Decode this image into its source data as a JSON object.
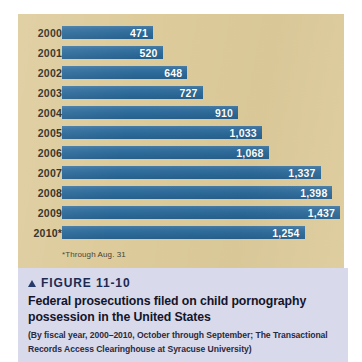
{
  "colors": {
    "panel_background": "#ddcb9b",
    "bar_fill": "#2c6a9a",
    "caption_background": "#d8d9ea",
    "heading_text": "#1c2a52",
    "page_background": "#ffffff"
  },
  "chart": {
    "footnote": "*Through Aug. 31"
  },
  "caption": {
    "marker_icon": "up-triangle-icon",
    "figure_label": "FIGURE 11-10",
    "title_line_1": "Federal prosecutions filed on child pornography",
    "title_line_2": "possession in the United States",
    "source_line_1": "(By fiscal year, 2000–2010, October through September; The Transactional",
    "source_line_2": "Records Access Clearinghouse at Syracuse University)"
  },
  "chart_data": {
    "type": "bar",
    "orientation": "horizontal",
    "title": "Federal prosecutions filed on child pornography possession in the United States",
    "subtitle": "(By fiscal year, 2000–2010, October through September; The Transactional Records Access Clearinghouse at Syracuse University)",
    "xlabel": "",
    "ylabel": "",
    "grid": false,
    "legend": false,
    "xlim": [
      0,
      1437
    ],
    "categories": [
      "2000",
      "2001",
      "2002",
      "2003",
      "2004",
      "2005",
      "2006",
      "2007",
      "2008",
      "2009",
      "2010*"
    ],
    "values": [
      471,
      520,
      648,
      727,
      910,
      1033,
      1068,
      1337,
      1398,
      1437,
      1254
    ],
    "value_labels": [
      "471",
      "520",
      "648",
      "727",
      "910",
      "1,033",
      "1,068",
      "1,337",
      "1,398",
      "1,437",
      "1,254"
    ],
    "annotations": [
      "*Through Aug. 31"
    ],
    "series": [
      {
        "name": "Federal prosecutions filed",
        "values": [
          471,
          520,
          648,
          727,
          910,
          1033,
          1068,
          1337,
          1398,
          1437,
          1254
        ]
      }
    ]
  }
}
